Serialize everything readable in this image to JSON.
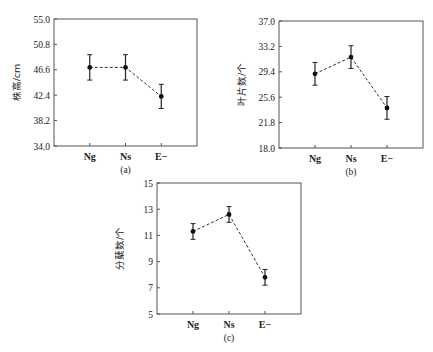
{
  "chart_data": [
    {
      "type": "line",
      "subtitle": "(a)",
      "ylabel": "株高/cm",
      "xlabel": "",
      "categories": [
        "Ng",
        "Ns",
        "E−"
      ],
      "values": [
        47.0,
        47.0,
        42.2
      ],
      "errors": [
        2.1,
        2.1,
        2.0
      ],
      "yticks": [
        "34.0",
        "38.2",
        "42.4",
        "46.6",
        "50.8",
        "55.0"
      ],
      "ylim": [
        34.0,
        55.0
      ],
      "grid": false,
      "line_style": "dashed",
      "frame": {
        "x0": 54,
        "y0": 19,
        "x1": 197,
        "y1": 146
      }
    },
    {
      "type": "line",
      "subtitle": "(b)",
      "ylabel": "叶片数/个",
      "xlabel": "",
      "categories": [
        "Ng",
        "Ns",
        "E−"
      ],
      "values": [
        29.1,
        31.6,
        24.0
      ],
      "errors": [
        1.7,
        1.7,
        1.7
      ],
      "yticks": [
        "18.0",
        "21.8",
        "25.6",
        "29.4",
        "33.2",
        "37.0"
      ],
      "ylim": [
        18.0,
        37.0
      ],
      "grid": false,
      "line_style": "dashed",
      "frame": {
        "x0": 279,
        "y0": 21,
        "x1": 423,
        "y1": 148
      }
    },
    {
      "type": "line",
      "subtitle": "(c)",
      "ylabel": "分蘖数/个",
      "xlabel": "",
      "categories": [
        "Ng",
        "Ns",
        "E−"
      ],
      "values": [
        11.3,
        12.6,
        7.8
      ],
      "errors": [
        0.6,
        0.6,
        0.6
      ],
      "yticks": [
        "5",
        "7",
        "9",
        "11",
        "13",
        "15"
      ],
      "ylim": [
        5,
        15
      ],
      "grid": false,
      "line_style": "dashed",
      "frame": {
        "x0": 157,
        "y0": 183,
        "x1": 301,
        "y1": 314
      }
    }
  ]
}
